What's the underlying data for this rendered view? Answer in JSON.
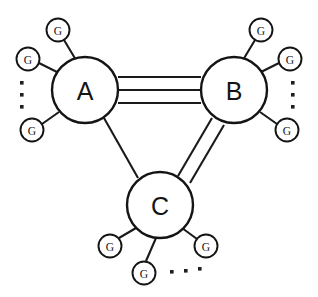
{
  "diagram": {
    "canvas": {
      "width": 318,
      "height": 297,
      "background": "#ffffff"
    },
    "stroke_color": "#141414",
    "fill_color": "#ffffff",
    "nodes": [
      {
        "id": "A",
        "label": "A",
        "cx": 85,
        "cy": 90,
        "r": 33
      },
      {
        "id": "B",
        "label": "B",
        "cx": 234,
        "cy": 90,
        "r": 33
      },
      {
        "id": "C",
        "label": "C",
        "cx": 160,
        "cy": 205,
        "r": 33
      }
    ],
    "edges": [
      {
        "id": "edge-a-b",
        "from": "A",
        "to": "B",
        "multiplicity": 3,
        "style": "triple"
      },
      {
        "id": "edge-b-c",
        "from": "B",
        "to": "C",
        "multiplicity": 2,
        "style": "double"
      },
      {
        "id": "edge-a-c",
        "from": "A",
        "to": "C",
        "multiplicity": 1,
        "style": "single"
      }
    ],
    "leaf_label": "G",
    "leaves": [
      {
        "id": "leaf-a-1",
        "parent": "A",
        "label": "G",
        "cx": 58,
        "cy": 30,
        "r": 11.5
      },
      {
        "id": "leaf-a-2",
        "parent": "A",
        "label": "G",
        "cx": 28,
        "cy": 59,
        "r": 11.5
      },
      {
        "id": "leaf-a-3",
        "parent": "A",
        "label": "G",
        "cx": 32,
        "cy": 130,
        "r": 11.5
      },
      {
        "id": "leaf-b-1",
        "parent": "B",
        "label": "G",
        "cx": 261,
        "cy": 30,
        "r": 11.5
      },
      {
        "id": "leaf-b-2",
        "parent": "B",
        "label": "G",
        "cx": 290,
        "cy": 59,
        "r": 11.5
      },
      {
        "id": "leaf-b-3",
        "parent": "B",
        "label": "G",
        "cx": 287,
        "cy": 130,
        "r": 11.5
      },
      {
        "id": "leaf-c-1",
        "parent": "C",
        "label": "G",
        "cx": 110,
        "cy": 246,
        "r": 11.5
      },
      {
        "id": "leaf-c-2",
        "parent": "C",
        "label": "G",
        "cx": 144,
        "cy": 273,
        "r": 11.5
      },
      {
        "id": "leaf-c-3",
        "parent": "C",
        "label": "G",
        "cx": 206,
        "cy": 246,
        "r": 11.5
      }
    ],
    "ellipses": [
      {
        "id": "ellipsis-a",
        "near": "A",
        "orientation": "vertical",
        "dots": [
          {
            "cx": 22,
            "cy": 83
          },
          {
            "cx": 22,
            "cy": 95
          },
          {
            "cx": 22,
            "cy": 107
          }
        ]
      },
      {
        "id": "ellipsis-b",
        "near": "B",
        "orientation": "vertical",
        "dots": [
          {
            "cx": 293,
            "cy": 83
          },
          {
            "cx": 293,
            "cy": 95
          },
          {
            "cx": 293,
            "cy": 107
          }
        ]
      },
      {
        "id": "ellipsis-c",
        "near": "C",
        "orientation": "horizontal",
        "dots": [
          {
            "cx": 172,
            "cy": 272
          },
          {
            "cx": 186,
            "cy": 271
          },
          {
            "cx": 200,
            "cy": 269
          }
        ]
      }
    ]
  }
}
